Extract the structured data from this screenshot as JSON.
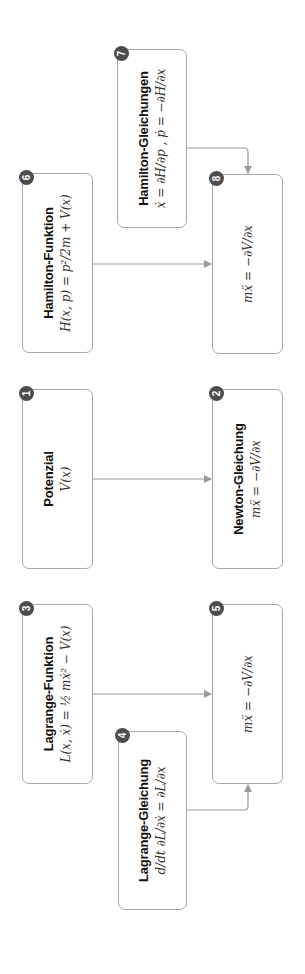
{
  "diagram": {
    "nodes": [
      {
        "id": 1,
        "title": "Potenzial",
        "formula": "V(x)"
      },
      {
        "id": 2,
        "title": "Newton-Gleichung",
        "formula": "mẍ = −∂V/∂x"
      },
      {
        "id": 3,
        "title": "Lagrange-Funktion",
        "formula": "L(x, ẋ) = ½ mẋ² − V(x)"
      },
      {
        "id": 4,
        "title": "Lagrange-Gleichung",
        "formula": "d/dt ∂L/∂ẋ = ∂L/∂x"
      },
      {
        "id": 5,
        "title": "",
        "formula": "mẍ = −∂V/∂x"
      },
      {
        "id": 6,
        "title": "Hamilton-Funktion",
        "formula": "H(x, p) = p²/2m + V(x)"
      },
      {
        "id": 7,
        "title": "Hamilton-Gleichungen",
        "formula": "ẋ = ∂H/∂p ,  ṗ = −∂H/∂x"
      },
      {
        "id": 8,
        "title": "",
        "formula": "mẍ = −∂V/∂x"
      }
    ],
    "edges": [
      {
        "from": 1,
        "to": 2
      },
      {
        "from": 3,
        "to": 5
      },
      {
        "from": 4,
        "to": 5
      },
      {
        "from": 6,
        "to": 8
      },
      {
        "from": 7,
        "to": 8
      }
    ],
    "colors": {
      "border": "#a9a9a9",
      "badge": "#4d4d4d",
      "arrow": "#999999"
    }
  }
}
